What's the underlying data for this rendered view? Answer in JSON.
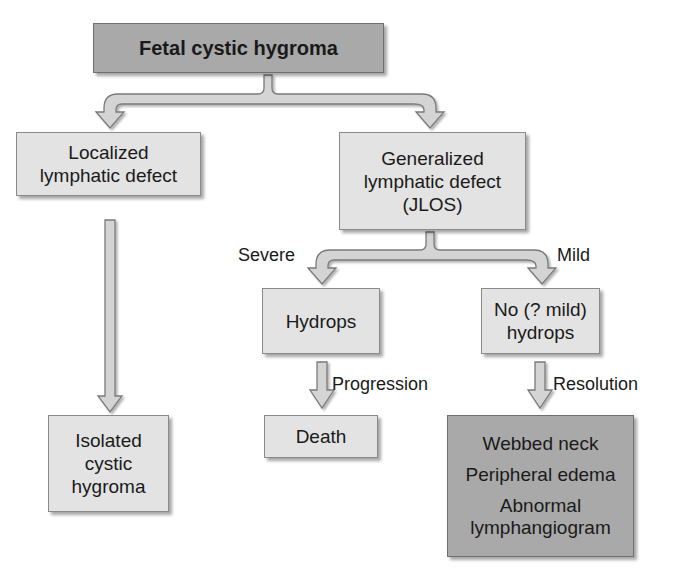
{
  "diagram": {
    "root": {
      "label": "Fetal cystic hygroma"
    },
    "left_branch": {
      "label_lines": [
        "Localized",
        "lymphatic defect"
      ],
      "outcome": {
        "label_lines": [
          "Isolated",
          "cystic",
          "hygroma"
        ]
      }
    },
    "right_branch": {
      "label_lines": [
        "Generalized",
        "lymphatic defect",
        "(JLOS)"
      ],
      "severe": {
        "edge_label": "Severe",
        "node": {
          "label": "Hydrops"
        },
        "next_edge_label": "Progression",
        "outcome": {
          "label": "Death"
        }
      },
      "mild": {
        "edge_label": "Mild",
        "node": {
          "label_lines": [
            "No (? mild)",
            "hydrops"
          ]
        },
        "next_edge_label": "Resolution",
        "outcome": {
          "label_lines": [
            "Webbed neck",
            "Peripheral edema",
            "Abnormal",
            "lymphangiogram"
          ]
        }
      }
    },
    "colors": {
      "light_box": "#e3e3e3",
      "dark_box": "#a9a9a9",
      "arrow_fill": "#d4d4d4",
      "arrow_stroke": "#777777"
    }
  }
}
